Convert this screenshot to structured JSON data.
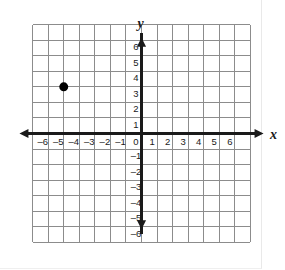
{
  "figure": {
    "name": "coordinate-plane"
  },
  "axes": {
    "x_label": "x",
    "y_label": "y",
    "origin_label": "0",
    "x_ticks": [
      "–6",
      "–5",
      "–4",
      "–3",
      "–2",
      "–1",
      "1",
      "2",
      "3",
      "4",
      "5",
      "6"
    ],
    "y_ticks": [
      "6",
      "5",
      "4",
      "3",
      "2",
      "1",
      "–1",
      "–2",
      "–3",
      "–4",
      "–5",
      "–6"
    ]
  },
  "colors": {
    "grid": "#8c8c8c",
    "axis": "#1a1a1a",
    "point": "#000000",
    "background": "#ffffff",
    "label": "#1a1a1a"
  },
  "chart_data": {
    "type": "scatter",
    "title": "",
    "xlabel": "x",
    "ylabel": "y",
    "xlim": [
      -7,
      7
    ],
    "ylim": [
      -7,
      7
    ],
    "xticks": [
      -6,
      -5,
      -4,
      -3,
      -2,
      -1,
      0,
      1,
      2,
      3,
      4,
      5,
      6
    ],
    "yticks": [
      -6,
      -5,
      -4,
      -3,
      -2,
      -1,
      0,
      1,
      2,
      3,
      4,
      5,
      6
    ],
    "grid": true,
    "legend": null,
    "series": [
      {
        "name": "plotted-point",
        "points": [
          {
            "x": -5,
            "y": 3,
            "label": ""
          }
        ],
        "marker": "filled-circle",
        "color": "#000000",
        "size": 9
      }
    ]
  }
}
